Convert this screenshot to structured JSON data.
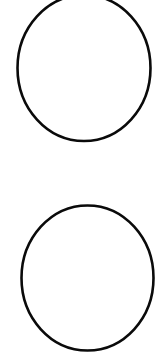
{
  "canvas": {
    "width": 164,
    "height": 356,
    "background": "#ffffff"
  },
  "shapes": [
    {
      "id": "top-oval",
      "type": "ellipse",
      "cx": 84,
      "cy": 68,
      "rx": 66.5,
      "ry": 73,
      "stroke": "#0a0a0a",
      "stroke_width": 2.6,
      "fill": "none"
    },
    {
      "id": "bottom-oval",
      "type": "ellipse",
      "cx": 87.5,
      "cy": 278,
      "rx": 66,
      "ry": 72.5,
      "stroke": "#0a0a0a",
      "stroke_width": 2.6,
      "fill": "none"
    }
  ]
}
